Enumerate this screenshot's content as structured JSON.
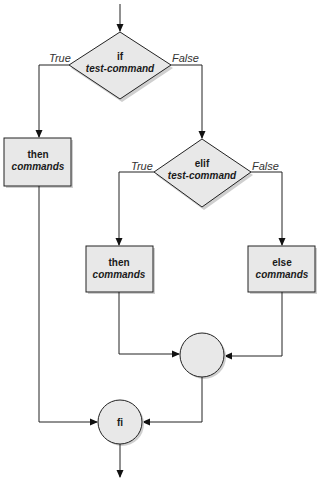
{
  "diagram": {
    "type": "flowchart",
    "colors": {
      "fill": "#e8e8e8",
      "stroke": "#222222",
      "shadow": "#c8c8c8",
      "background": "#ffffff"
    },
    "nodes": {
      "if_decision": {
        "line1": "if",
        "line2": "test-command"
      },
      "then1": {
        "line1": "then",
        "line2": "commands"
      },
      "elif_decision": {
        "line1": "elif",
        "line2": "test-command"
      },
      "then2": {
        "line1": "then",
        "line2": "commands"
      },
      "else": {
        "line1": "else",
        "line2": "commands"
      },
      "merge": {
        "label": ""
      },
      "fi": {
        "label": "fi"
      }
    },
    "edge_labels": {
      "if_true": "True",
      "if_false": "False",
      "elif_true": "True",
      "elif_false": "False"
    }
  }
}
